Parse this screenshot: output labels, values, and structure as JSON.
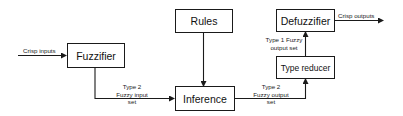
{
  "diagram": {
    "nodes": {
      "fuzzifier": "Fuzzifier",
      "rules": "Rules",
      "inference": "Inference",
      "type_reducer": "Type reducer",
      "defuzzifier": "Defuzzifier"
    },
    "edges": {
      "crisp_inputs": "Crisp inputs",
      "fuzzy_input_line1": "Type 2",
      "fuzzy_input_line2": "Fuzzy input",
      "fuzzy_input_line3": "set",
      "fuzzy_output_line1": "Type 2",
      "fuzzy_output_line2": "Fuzzy output",
      "fuzzy_output_line3": "set",
      "type1_line1": "Type 1 Fuzzy",
      "type1_line2": "output set",
      "crisp_outputs": "Crisp outputs"
    },
    "colors": {
      "stroke": "#1a1a1a",
      "background": "#ffffff"
    }
  }
}
